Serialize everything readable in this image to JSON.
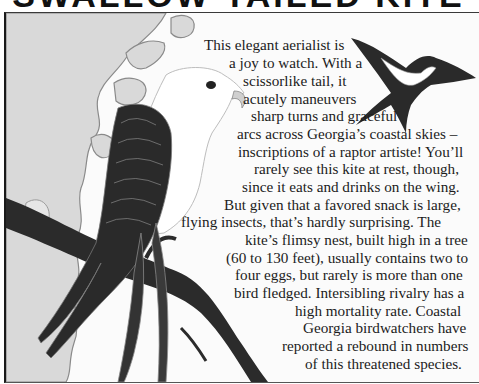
{
  "header": {
    "title": "SWALLOW-TAILED KITE"
  },
  "illustration": {
    "main_bird": "swallow-tailed kite perched on branch",
    "flying_bird": "swallow-tailed kite in flight",
    "background": "map of coastal Georgia",
    "colors": {
      "land": "#d9d9d9",
      "coast_outline": "#8a8a8a",
      "water": "#f4f4f4",
      "wing_dark": "#2a2a2a",
      "branch": "#2b2b2b",
      "bird_white": "#ffffff"
    }
  },
  "article": {
    "lines": [
      "This elegant aerialist is",
      "a joy to watch. With a",
      "scissorlike tail, it",
      "acutely maneuvers",
      "sharp turns and graceful",
      "arcs across Georgia’s coastal skies –",
      "inscriptions of a raptor artiste! You’ll",
      "rarely see this kite at rest, though,",
      "since it eats and drinks on the wing.",
      "But given that a favored snack is large,",
      "flying insects, that’s hardly surprising. The",
      "kite’s flimsy nest, built high in a tree",
      "(60 to 130 feet), usually contains two to",
      "four eggs, but rarely is more than one",
      "bird fledged. Intersibling rivalry has a",
      "high mortality rate. Coastal",
      "Georgia birdwatchers have",
      "reported a rebound in numbers",
      "of this threatened species."
    ]
  }
}
